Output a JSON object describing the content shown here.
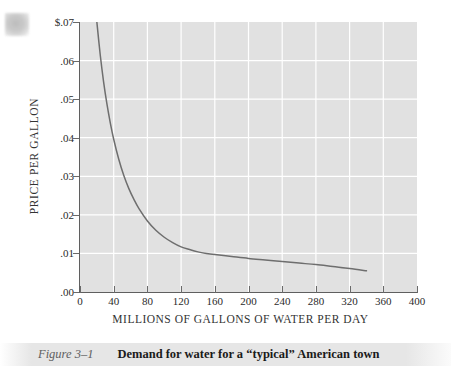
{
  "figure": {
    "caption_number": "Figure 3–1",
    "caption_title": "Demand for water for a “typical” American town"
  },
  "colors": {
    "plot_background": "#e1e1e1",
    "gridline": "#ffffff",
    "curve": "#6e6e6e",
    "axis": "#5f5f5f",
    "text": "#2b2b2b",
    "caption_number_text": "#606060"
  },
  "chart_data": {
    "type": "line",
    "title": "Demand for water for a “typical” American town",
    "subtitle": "",
    "xlabel": "MILLIONS OF GALLONS OF WATER PER DAY",
    "ylabel": "PRICE PER GALLON",
    "xlim": [
      0,
      400
    ],
    "ylim": [
      0.0,
      0.07
    ],
    "grid": true,
    "legend": "none",
    "xticks": [
      0,
      40,
      80,
      120,
      160,
      200,
      240,
      280,
      320,
      360,
      400
    ],
    "xtick_labels": [
      "0",
      "40",
      "80",
      "120",
      "160",
      "200",
      "240",
      "280",
      "320",
      "360",
      "400"
    ],
    "yticks": [
      0.0,
      0.01,
      0.02,
      0.03,
      0.04,
      0.05,
      0.06,
      0.07
    ],
    "ytick_labels": [
      ".00",
      ".01",
      ".02",
      ".03",
      ".04",
      ".05",
      ".06",
      "$.07"
    ],
    "series": [
      {
        "name": "Demand for water",
        "x": [
          20,
          24,
          28,
          32,
          36,
          40,
          46,
          52,
          58,
          64,
          70,
          80,
          90,
          100,
          110,
          120,
          130,
          140,
          150,
          160,
          180,
          200,
          220,
          240,
          260,
          280,
          300,
          320,
          340
        ],
        "y": [
          0.07,
          0.0615,
          0.0545,
          0.0487,
          0.0438,
          0.0396,
          0.0344,
          0.0302,
          0.0268,
          0.024,
          0.0216,
          0.0184,
          0.016,
          0.0142,
          0.0128,
          0.0117,
          0.011,
          0.0104,
          0.01,
          0.0097,
          0.0092,
          0.0087,
          0.0083,
          0.0079,
          0.0075,
          0.0071,
          0.0066,
          0.0061,
          0.0055
        ]
      }
    ]
  }
}
